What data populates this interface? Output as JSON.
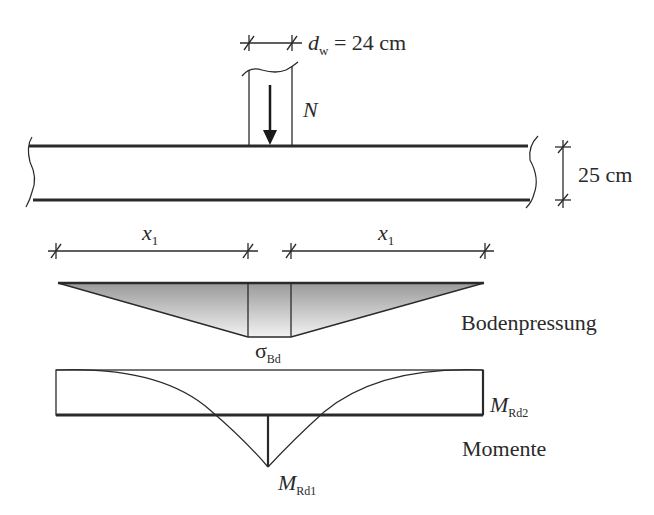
{
  "diagram": {
    "type": "foundation-slab-load-diagram",
    "column_width_label": {
      "symbol": "d",
      "subscript": "w",
      "value": " = 24 cm"
    },
    "axial_force_label": "N",
    "slab_thickness_label": "25 cm",
    "left_span_label": {
      "symbol": "x",
      "subscript": "1"
    },
    "right_span_label": {
      "symbol": "x",
      "subscript": "1"
    },
    "soil_pressure": {
      "symbol": "σ",
      "subscript": "Bd",
      "title": "Bodenpressung"
    },
    "moments": {
      "title": "Momente",
      "mrd2": {
        "symbol": "M",
        "subscript": "Rd2"
      },
      "mrd1": {
        "symbol": "M",
        "subscript": "Rd1"
      }
    },
    "colors": {
      "line": "#2a2a2a",
      "fill_dark": "#9a9a9a",
      "fill_light": "#f2f2f2"
    }
  }
}
